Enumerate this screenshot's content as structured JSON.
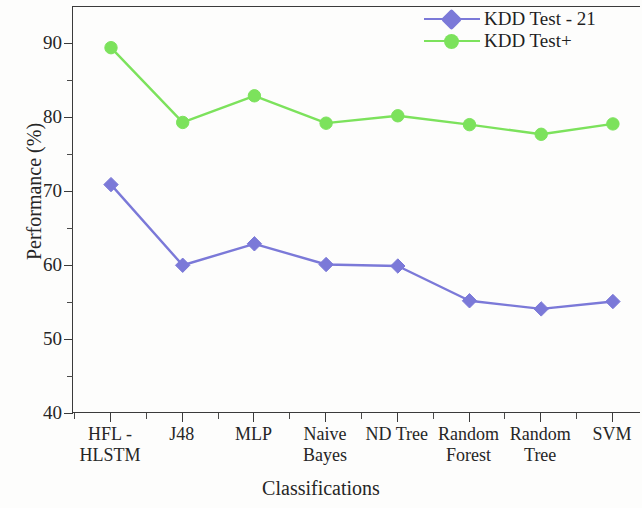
{
  "chart_data": {
    "type": "line",
    "title": "",
    "xlabel": "Classifications",
    "ylabel": "Performance (%)",
    "categories": [
      "HFL - HLSTM",
      "J48",
      "MLP",
      "Naive Bayes",
      "ND Tree",
      "Random Forest",
      "Random Tree",
      "SVM"
    ],
    "category_lines": [
      [
        "HFL -",
        "HLSTM"
      ],
      [
        "J48",
        ""
      ],
      [
        "MLP",
        ""
      ],
      [
        "Naive",
        "Bayes"
      ],
      [
        "ND Tree",
        ""
      ],
      [
        "Random",
        "Forest"
      ],
      [
        "Random",
        "Tree"
      ],
      [
        "SVM",
        ""
      ]
    ],
    "series": [
      {
        "name": "KDD Test - 21",
        "color": "#7b79d8",
        "marker": "diamond",
        "values": [
          71.0,
          60.1,
          63.0,
          60.2,
          60.0,
          55.3,
          54.2,
          55.2
        ]
      },
      {
        "name": "KDD Test+",
        "color": "#7ce25c",
        "marker": "circle",
        "values": [
          89.5,
          79.4,
          83.0,
          79.3,
          80.3,
          79.1,
          77.8,
          79.2
        ]
      }
    ],
    "ylim": [
      40,
      90.3
    ],
    "ytick_labels": [
      "90",
      "80",
      "70",
      "60",
      "50",
      "40"
    ],
    "ytick_values": [
      90,
      80,
      70,
      60,
      50,
      40
    ],
    "ytick_minor_values": [
      85,
      75,
      65,
      55,
      45
    ],
    "grid": false,
    "legend_position": "top-right"
  },
  "legend": {
    "entries": [
      {
        "label": "KDD Test - 21"
      },
      {
        "label": "KDD Test+"
      }
    ]
  }
}
